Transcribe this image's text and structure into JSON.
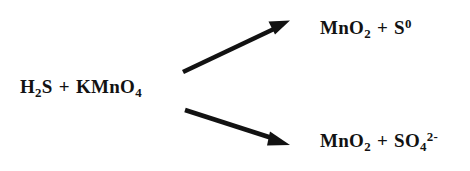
{
  "diagram": {
    "type": "chemical-reaction-branching",
    "background_color": "#ffffff",
    "ink_color": "#121212",
    "reactants": {
      "species_1": {
        "base": "H",
        "sub": "2",
        "tail": "S"
      },
      "operator": "+",
      "species_2": {
        "base": "KMnO",
        "sub": "4",
        "tail": ""
      }
    },
    "arrows": [
      {
        "name": "upper-reaction-arrow",
        "direction": "up-right",
        "from_x": 183,
        "from_y": 72,
        "to_x": 288,
        "to_y": 22
      },
      {
        "name": "lower-reaction-arrow",
        "direction": "down-right",
        "from_x": 185,
        "from_y": 110,
        "to_x": 288,
        "to_y": 144
      }
    ],
    "products": {
      "top": {
        "species_1": {
          "base": "MnO",
          "sub": "2",
          "sup": ""
        },
        "operator": "+",
        "species_2": {
          "base": "S",
          "sub": "",
          "sup": "0"
        }
      },
      "bottom": {
        "species_1": {
          "base": "MnO",
          "sub": "2",
          "sup": ""
        },
        "operator": "+",
        "species_2": {
          "base": "SO",
          "sub": "4",
          "sup": "2-"
        }
      }
    }
  }
}
